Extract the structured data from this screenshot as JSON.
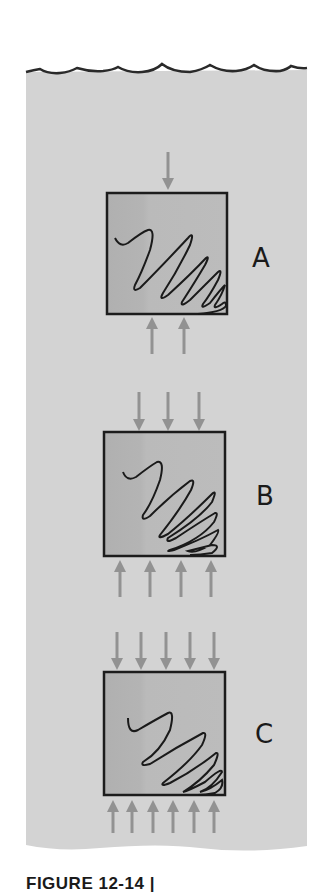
{
  "figure": {
    "caption": "FIGURE 12-14 |",
    "colors": {
      "water": "#d3d3d3",
      "box_fill": "#b9b9b9",
      "box_fill_dark": "#b0b0b0",
      "box_stroke": "#1c1c1c",
      "arrow": "#929292",
      "wave_line": "#2a2a2a",
      "scribble": "#1a1a1a"
    },
    "panels": [
      {
        "label": "A",
        "top_arrows": 1,
        "bottom_arrows": 2,
        "description": "low pressure"
      },
      {
        "label": "B",
        "top_arrows": 3,
        "bottom_arrows": 4,
        "description": "medium pressure"
      },
      {
        "label": "C",
        "top_arrows": 5,
        "bottom_arrows": 6,
        "description": "high pressure"
      }
    ]
  }
}
